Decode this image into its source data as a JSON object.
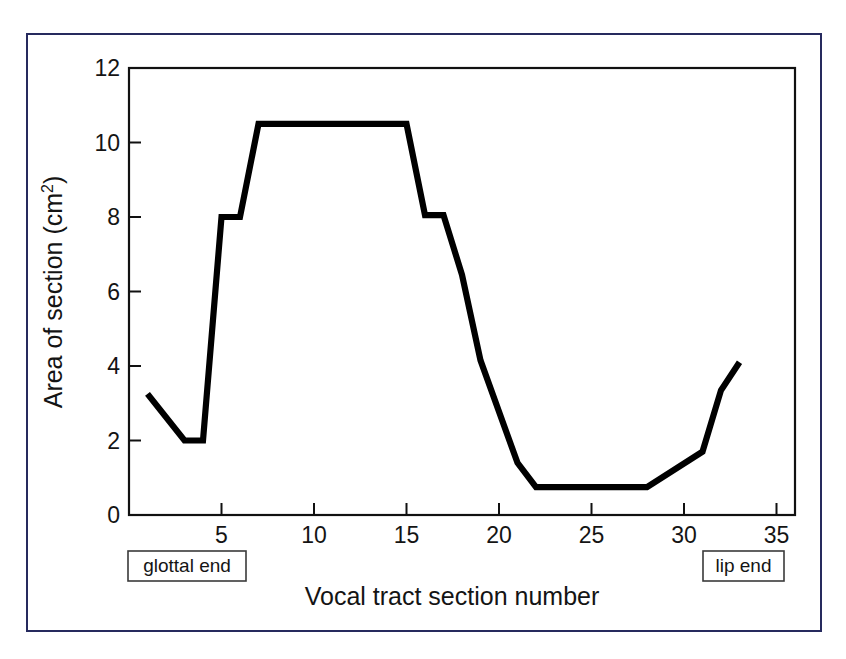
{
  "figure": {
    "border_color": "#262a5e",
    "background": "#ffffff"
  },
  "chart_data": {
    "type": "line",
    "title": "",
    "xlabel": "Vocal tract section number",
    "ylabel": "Area of section (cm2)",
    "ylabel_base": "Area of section (cm",
    "ylabel_sup": "2",
    "ylabel_close": ")",
    "xlim": [
      0,
      36
    ],
    "ylim": [
      0,
      12
    ],
    "xticks": [
      5,
      10,
      15,
      20,
      25,
      30,
      35
    ],
    "xtick_labels": [
      "5",
      "10",
      "15",
      "20",
      "25",
      "30",
      "35"
    ],
    "yticks": [
      0,
      2,
      4,
      6,
      8,
      10,
      12
    ],
    "ytick_labels": [
      "0",
      "2",
      "4",
      "6",
      "8",
      "10",
      "12"
    ],
    "grid": false,
    "legend": false,
    "line_color": "#000000",
    "x": [
      1,
      3,
      4,
      5,
      6,
      7,
      15,
      16,
      17,
      18,
      19,
      21,
      22,
      28,
      31,
      32,
      33
    ],
    "values": [
      3.25,
      2.0,
      2.0,
      8.0,
      8.0,
      10.5,
      10.5,
      8.05,
      8.05,
      6.45,
      4.15,
      1.4,
      0.75,
      0.75,
      1.7,
      3.35,
      4.1
    ],
    "annotations": [
      {
        "name": "glottal-end",
        "text": "glottal end",
        "x": 4.0,
        "boxed": true
      },
      {
        "name": "lip-end",
        "text": "lip end",
        "x": 33.0,
        "boxed": true
      }
    ]
  }
}
